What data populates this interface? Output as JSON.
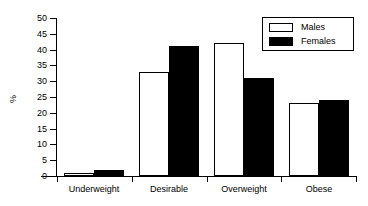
{
  "chart_data": {
    "type": "bar",
    "title": "",
    "xlabel": "",
    "ylabel": "%",
    "ylim": [
      0,
      50
    ],
    "yticks": [
      0,
      5,
      10,
      15,
      20,
      25,
      30,
      35,
      40,
      45,
      50
    ],
    "ytick_labels": [
      "0",
      "5",
      "10",
      "15",
      "20",
      "25",
      "30",
      "35",
      "40",
      "45",
      "50"
    ],
    "grid": false,
    "legend_position": "top-right",
    "categories": [
      "Underweight",
      "Desirable",
      "Overweight",
      "Obese"
    ],
    "series": [
      {
        "name": "Males",
        "color": "#ffffff",
        "edge_color": "#000000",
        "values": [
          1,
          33,
          42,
          23
        ]
      },
      {
        "name": "Females",
        "color": "#000000",
        "edge_color": "#000000",
        "values": [
          2,
          41,
          31,
          24
        ]
      }
    ]
  },
  "legend": {
    "entries": [
      {
        "label": "Males",
        "swatch": "males"
      },
      {
        "label": "Females",
        "swatch": "females"
      }
    ]
  },
  "axis": {
    "y_title": "%"
  }
}
